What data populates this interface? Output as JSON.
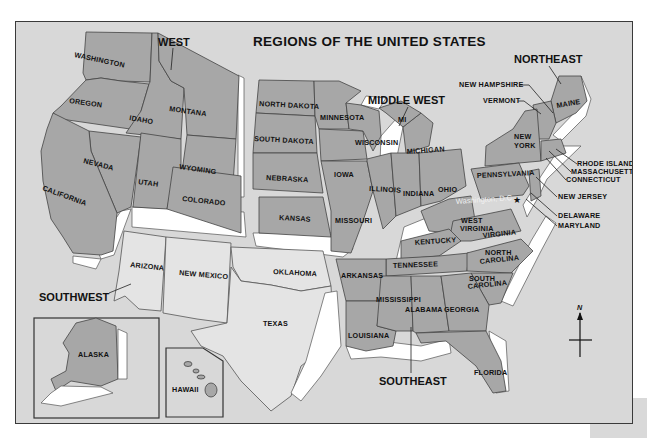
{
  "map": {
    "title": "REGIONS OF THE UNITED STATES",
    "regions": {
      "west": "WEST",
      "middle_west": "MIDDLE WEST",
      "northeast": "NORTHEAST",
      "southwest": "SOUTHWEST",
      "southeast": "SOUTHEAST"
    },
    "states": {
      "washington": "WASHINGTON",
      "oregon": "OREGON",
      "idaho": "IDAHO",
      "montana": "MONTANA",
      "wyoming": "WYOMING",
      "nevada": "NEVADA",
      "utah": "UTAH",
      "colorado": "COLORADO",
      "california": "CALIFORNIA",
      "alaska": "ALASKA",
      "hawaii": "HAWAII",
      "arizona": "ARIZONA",
      "new_mexico": "NEW MEXICO",
      "oklahoma": "OKLAHOMA",
      "texas": "TEXAS",
      "north_dakota": "NORTH DAKOTA",
      "south_dakota": "SOUTH DAKOTA",
      "nebraska": "NEBRASKA",
      "kansas": "KANSAS",
      "minnesota": "MINNESOTA",
      "iowa": "IOWA",
      "missouri": "MISSOURI",
      "wisconsin": "WISCONSIN",
      "illinois": "ILLINOIS",
      "michigan": "MICHIGAN",
      "mi": "MI",
      "indiana": "INDIANA",
      "ohio": "OHIO",
      "new_hampshire": "NEW HAMPSHIRE",
      "vermont": "VERMONT",
      "maine": "MAINE",
      "new_york_1": "NEW",
      "new_york_2": "YORK",
      "pennsylvania": "PENNSYLVANIA",
      "rhode_island": "RHODE ISLAND",
      "massachusetts": "MASSACHUSETTS",
      "connecticut": "CONNECTICUT",
      "new_jersey": "NEW JERSEY",
      "delaware": "DELAWARE",
      "maryland": "MARYLAND",
      "washington_dc": "Washington, D.C.",
      "west_virginia_1": "WEST",
      "west_virginia_2": "VIRGINIA",
      "virginia": "VIRGINIA",
      "kentucky": "KENTUCKY",
      "tennessee": "TENNESSEE",
      "north_carolina_1": "NORTH",
      "north_carolina_2": "CAROLINA",
      "south_carolina_1": "SOUTH",
      "south_carolina_2": "CAROLINA",
      "arkansas": "ARKANSAS",
      "louisiana": "LOUISIANA",
      "mississippi": "MISSISSIPPI",
      "alabama": "ALABAMA",
      "georgia": "GEORGIA",
      "florida": "FLORIDA"
    },
    "compass": {
      "north_label": "N"
    },
    "colors": {
      "background": "#d8d8d8",
      "region_dark": "#a7a7a7",
      "region_light": "#e4e4e4",
      "relief": "#ffffff",
      "border": "#3a3a3a"
    }
  }
}
